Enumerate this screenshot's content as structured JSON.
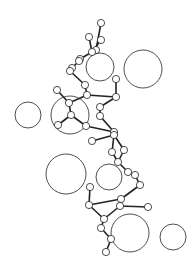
{
  "figure": {
    "title": "",
    "colors": {
      "background": "#ffffff",
      "stroke": "#222222"
    },
    "large_spheres": [
      {
        "cx": 100,
        "cy": 67,
        "r": 14
      },
      {
        "cx": 143,
        "cy": 69,
        "r": 19
      },
      {
        "cx": 28,
        "cy": 115,
        "r": 13
      },
      {
        "cx": 70,
        "cy": 115,
        "r": 19
      },
      {
        "cx": 66,
        "cy": 174,
        "r": 20
      },
      {
        "cx": 109,
        "cy": 177,
        "r": 13
      },
      {
        "cx": 130,
        "cy": 233,
        "r": 19
      },
      {
        "cx": 173,
        "cy": 237,
        "r": 13
      }
    ],
    "atoms": [
      [
        101,
        23
      ],
      [
        89,
        37
      ],
      [
        101,
        40
      ],
      [
        96,
        50
      ],
      [
        92,
        52
      ],
      [
        80,
        59
      ],
      [
        79,
        61
      ],
      [
        72,
        68
      ],
      [
        70,
        71
      ],
      [
        85,
        85
      ],
      [
        87,
        95
      ],
      [
        116,
        79
      ],
      [
        116,
        97
      ],
      [
        57,
        90
      ],
      [
        69,
        103
      ],
      [
        71,
        115
      ],
      [
        58,
        125
      ],
      [
        86,
        126
      ],
      [
        100,
        107
      ],
      [
        100,
        116
      ],
      [
        114,
        132
      ],
      [
        92,
        141
      ],
      [
        114,
        135
      ],
      [
        112,
        152
      ],
      [
        124,
        150
      ],
      [
        118,
        162
      ],
      [
        128,
        172
      ],
      [
        135,
        175
      ],
      [
        140,
        185
      ],
      [
        121,
        199
      ],
      [
        90,
        187
      ],
      [
        89,
        205
      ],
      [
        120,
        206
      ],
      [
        148,
        207
      ],
      [
        104,
        219
      ],
      [
        101,
        228
      ],
      [
        111,
        239
      ],
      [
        106,
        252
      ]
    ],
    "bonds": [
      [
        0,
        3
      ],
      [
        1,
        4
      ],
      [
        2,
        4
      ],
      [
        3,
        4
      ],
      [
        4,
        5
      ],
      [
        5,
        6
      ],
      [
        6,
        7
      ],
      [
        7,
        8
      ],
      [
        8,
        9
      ],
      [
        9,
        10
      ],
      [
        10,
        12
      ],
      [
        11,
        12
      ],
      [
        10,
        14
      ],
      [
        13,
        14
      ],
      [
        14,
        15
      ],
      [
        15,
        16
      ],
      [
        15,
        17
      ],
      [
        17,
        20
      ],
      [
        12,
        18
      ],
      [
        18,
        19
      ],
      [
        19,
        20
      ],
      [
        20,
        22
      ],
      [
        21,
        22
      ],
      [
        22,
        23
      ],
      [
        22,
        24
      ],
      [
        23,
        25
      ],
      [
        24,
        25
      ],
      [
        25,
        26
      ],
      [
        26,
        27
      ],
      [
        27,
        28
      ],
      [
        28,
        29
      ],
      [
        29,
        31
      ],
      [
        30,
        31
      ],
      [
        29,
        32
      ],
      [
        32,
        33
      ],
      [
        31,
        34
      ],
      [
        32,
        34
      ],
      [
        34,
        35
      ],
      [
        35,
        36
      ],
      [
        36,
        37
      ]
    ]
  }
}
